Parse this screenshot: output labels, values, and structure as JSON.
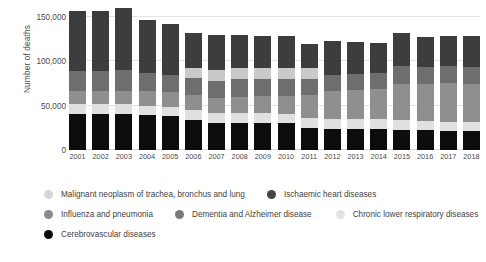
{
  "chart_data": {
    "type": "bar",
    "subtype": "stacked-bar",
    "title": "",
    "xlabel": "",
    "ylabel": "Number of deaths",
    "ylim": [
      0,
      160000
    ],
    "yticks": [
      0,
      50000,
      100000,
      150000
    ],
    "ytick_labels": [
      "0",
      "50,000",
      "100,000",
      "150,000"
    ],
    "grid": true,
    "legend_position": "bottom",
    "categories": [
      "2001",
      "2002",
      "2003",
      "2004",
      "2005",
      "2006",
      "2007",
      "2008",
      "2009",
      "2010",
      "2011",
      "2012",
      "2013",
      "2014",
      "2015",
      "2016",
      "2017",
      "2018"
    ],
    "series": [
      {
        "name": "Cerebrovascular diseases",
        "color": "#0d0d0d",
        "values": [
          41000,
          41000,
          41000,
          39000,
          38000,
          34000,
          31000,
          31000,
          31000,
          30000,
          25000,
          24000,
          24000,
          24000,
          23000,
          22000,
          21000,
          21000
        ]
      },
      {
        "name": "Chronic lower respiratory diseases",
        "color": "#e0e0e0",
        "values": [
          11000,
          11000,
          11000,
          11000,
          11000,
          11000,
          11000,
          11000,
          11000,
          11000,
          11000,
          11000,
          11000,
          11000,
          11000,
          11000,
          11000,
          11000
        ]
      },
      {
        "name": "Dementia and Alzheimer disease",
        "color": "#8f8f8f",
        "values": [
          15000,
          15000,
          15000,
          16000,
          16000,
          17000,
          17000,
          18000,
          19000,
          20000,
          26000,
          31000,
          33000,
          34000,
          40000,
          41000,
          43000,
          42000
        ]
      },
      {
        "name": "Influenza and pneumonia",
        "color": "#6e6e6e",
        "values": [
          22000,
          22000,
          23000,
          21000,
          20000,
          19000,
          19000,
          20000,
          19000,
          19000,
          18000,
          18000,
          18000,
          18000,
          21000,
          20000,
          20000,
          20000
        ]
      },
      {
        "name": "Malignant neoplasm of trachea, bronchus and lung",
        "color": "#c9c9c9",
        "values": [
          0,
          0,
          0,
          0,
          0,
          12000,
          12000,
          12000,
          12000,
          12000,
          12000,
          0,
          0,
          0,
          0,
          0,
          0,
          0
        ]
      },
      {
        "name": "Ischaemic heart diseases",
        "color": "#3d3d3d",
        "values": [
          68000,
          68000,
          70000,
          59000,
          57000,
          39000,
          40000,
          38000,
          36000,
          37000,
          28000,
          39000,
          36000,
          34000,
          37000,
          33000,
          34000,
          34000
        ]
      }
    ],
    "totals": [
      157000,
      157000,
      160000,
      146000,
      142000,
      132000,
      130000,
      130000,
      128000,
      129000,
      120000,
      123000,
      122000,
      121000,
      132000,
      127000,
      129000,
      128000
    ]
  },
  "axis": {
    "y_title": "Number of deaths"
  },
  "legend": {
    "rows": [
      [
        {
          "label": "Malignant neoplasm of trachea, bronchus and lung",
          "color": "#d6d6d6"
        },
        {
          "label": "Ischaemic heart diseases",
          "color": "#444444"
        }
      ],
      [
        {
          "label": "Influenza and pneumonia",
          "color": "#8a8a8a"
        },
        {
          "label": "Dementia and Alzheimer disease",
          "color": "#7a7a7a"
        },
        {
          "label": "Chronic lower respiratory diseases",
          "color": "#e2e2e2"
        }
      ],
      [
        {
          "label": "Cerebrovascular diseases",
          "color": "#0d0d0d"
        }
      ]
    ]
  }
}
